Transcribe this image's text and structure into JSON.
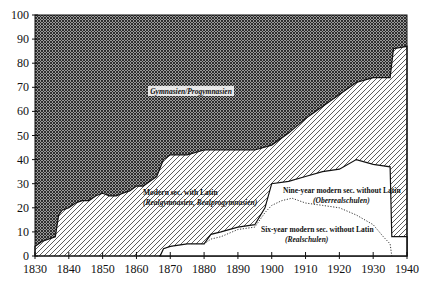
{
  "chart_data": {
    "type": "area",
    "title": "",
    "xlabel": "",
    "ylabel": "",
    "xlim": [
      1830,
      1940
    ],
    "ylim": [
      0,
      100
    ],
    "x_ticks": [
      1830,
      1840,
      1850,
      1860,
      1870,
      1880,
      1890,
      1900,
      1910,
      1920,
      1930,
      1940
    ],
    "y_ticks": [
      0,
      10,
      20,
      30,
      40,
      50,
      60,
      70,
      80,
      90,
      100
    ],
    "grid": false,
    "legend": "inline annotations",
    "stacked": true,
    "series": [
      {
        "name": "Six-year modern sec. without Latin (Realschulen)",
        "style": "dotted upper boundary, white fill",
        "points": [
          [
            1880,
            5
          ],
          [
            1882,
            7
          ],
          [
            1885,
            8
          ],
          [
            1890,
            11
          ],
          [
            1895,
            12
          ],
          [
            1898,
            18
          ],
          [
            1900,
            21
          ],
          [
            1903,
            23
          ],
          [
            1906,
            24
          ],
          [
            1910,
            22
          ],
          [
            1915,
            21
          ],
          [
            1920,
            20
          ],
          [
            1925,
            17
          ],
          [
            1930,
            13
          ],
          [
            1933,
            8
          ],
          [
            1935,
            5
          ],
          [
            1935.5,
            0
          ]
        ]
      },
      {
        "name": "Nine-year modern sec. without Latin (Oberrealschulen)",
        "style": "white fill, upper boundary cumulative",
        "points": [
          [
            1867,
            0
          ],
          [
            1868,
            3
          ],
          [
            1870,
            4
          ],
          [
            1875,
            5
          ],
          [
            1880,
            5
          ],
          [
            1882,
            9
          ],
          [
            1885,
            10
          ],
          [
            1890,
            12
          ],
          [
            1895,
            13
          ],
          [
            1898,
            20
          ],
          [
            1900,
            30
          ],
          [
            1905,
            31
          ],
          [
            1910,
            33
          ],
          [
            1915,
            35
          ],
          [
            1920,
            36
          ],
          [
            1925,
            40
          ],
          [
            1930,
            38
          ],
          [
            1935,
            37
          ],
          [
            1935.5,
            8
          ],
          [
            1940,
            8
          ]
        ]
      },
      {
        "name": "Modern sec. with Latin (Realgymnasien, Realprogymnasien)",
        "style": "diagonal hatch, upper boundary cumulative",
        "points": [
          [
            1830,
            4
          ],
          [
            1832,
            6
          ],
          [
            1834,
            7
          ],
          [
            1836,
            8
          ],
          [
            1837,
            17
          ],
          [
            1838,
            19
          ],
          [
            1840,
            20
          ],
          [
            1842,
            22
          ],
          [
            1844,
            23
          ],
          [
            1846,
            23
          ],
          [
            1848,
            25
          ],
          [
            1850,
            26
          ],
          [
            1852,
            25
          ],
          [
            1854,
            25
          ],
          [
            1856,
            26
          ],
          [
            1858,
            27
          ],
          [
            1860,
            29
          ],
          [
            1862,
            29
          ],
          [
            1864,
            31
          ],
          [
            1866,
            33
          ],
          [
            1868,
            40
          ],
          [
            1870,
            42
          ],
          [
            1875,
            42
          ],
          [
            1880,
            44
          ],
          [
            1885,
            44
          ],
          [
            1890,
            44
          ],
          [
            1895,
            44
          ],
          [
            1900,
            46
          ],
          [
            1905,
            51
          ],
          [
            1910,
            57
          ],
          [
            1912,
            59
          ],
          [
            1915,
            62
          ],
          [
            1920,
            67
          ],
          [
            1925,
            72
          ],
          [
            1930,
            74
          ],
          [
            1935,
            74
          ],
          [
            1936,
            86
          ],
          [
            1940,
            87
          ]
        ]
      },
      {
        "name": "Gymnasien/Progymnasien",
        "style": "cross-hatch, fills to 100",
        "points": [
          [
            1830,
            100
          ],
          [
            1940,
            100
          ]
        ]
      }
    ],
    "annotations": [
      {
        "text": "Gymnasien/Progymnasien",
        "italic": true
      },
      {
        "text": "Modern sec. with Latin",
        "italic": false
      },
      {
        "text": "(Realgymnasien, Realprogymnasien)",
        "italic": true
      },
      {
        "text": "Nine-year modern sec. without Latin",
        "italic": false
      },
      {
        "text": "(Oberrealschulen)",
        "italic": true
      },
      {
        "text": "Six-year modern sec. without Latin",
        "italic": false
      },
      {
        "text": "(Realschulen)",
        "italic": true
      }
    ]
  },
  "labels": {
    "gym": "Gymnasien/Progymnasien",
    "rg1": "Modern sec. with Latin",
    "rg2": "(Realgymnasien, Realprogymnasien)",
    "or1": "Nine-year modern sec. without Latin",
    "or2": "(Oberrealschulen)",
    "rs1": "Six-year modern sec. without Latin",
    "rs2": "(Realschulen)"
  },
  "axis": {
    "x": [
      "1830",
      "1840",
      "1850",
      "1860",
      "1870",
      "1880",
      "1890",
      "1900",
      "1910",
      "1920",
      "1930",
      "1940"
    ],
    "y": [
      "0",
      "10",
      "20",
      "30",
      "40",
      "50",
      "60",
      "70",
      "80",
      "90",
      "100"
    ]
  }
}
